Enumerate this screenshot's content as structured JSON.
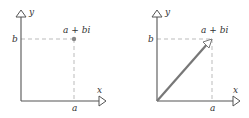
{
  "colors": {
    "axis": "#555555",
    "dashed": "#aaaaaa",
    "point": "#888888",
    "vector": "#777777",
    "label": "#333333"
  },
  "left_panel": {
    "x_axis_label": "x",
    "y_axis_label": "y",
    "point_label": "a + bi",
    "x_tick_label": "a",
    "y_tick_label": "b",
    "representation": "point"
  },
  "right_panel": {
    "x_axis_label": "x",
    "y_axis_label": "y",
    "point_label": "a + bi",
    "x_tick_label": "a",
    "y_tick_label": "b",
    "representation": "vector"
  }
}
